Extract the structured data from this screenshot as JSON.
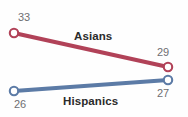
{
  "chart_data": {
    "type": "line",
    "title": "",
    "subtitle": "",
    "xlabel": "",
    "ylabel": "",
    "grid": false,
    "legend_position": "inline",
    "x": [
      "start",
      "end"
    ],
    "series": [
      {
        "name": "Asians",
        "values": [
          33,
          29
        ],
        "color": "#b14258",
        "start_label": "33",
        "end_label": "29"
      },
      {
        "name": "Hispanics",
        "values": [
          26,
          27
        ],
        "color": "#5c7ba6",
        "start_label": "26",
        "end_label": "27"
      }
    ],
    "annotations": [
      "Asians",
      "Hispanics"
    ],
    "marker_style": "open-circle",
    "value_label_color": "#6e6e72",
    "series_label_color": "#2b2b2b",
    "background": "#ffffff"
  },
  "geometry": {
    "asians": {
      "x1": 14,
      "y1": 33,
      "x2": 168,
      "y2": 67
    },
    "hispanics": {
      "x1": 14,
      "y1": 91,
      "x2": 168,
      "y2": 80
    },
    "marker_radius": 4.2,
    "line_width": 4.2
  }
}
